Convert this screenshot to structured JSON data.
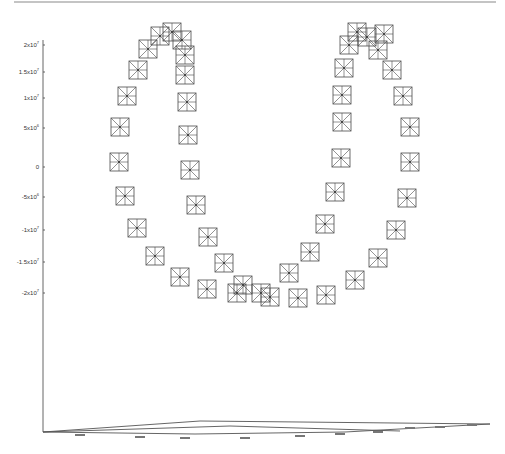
{
  "chart_data": {
    "type": "scatter",
    "projection": "3d",
    "title": "",
    "xlabel": "",
    "ylabel": "",
    "zlabel": "",
    "z_axis": {
      "tick_labels": [
        "2x10^7",
        "1.5x10^7",
        "1x10^7",
        "5x10^6",
        "0",
        "-5x10^6",
        "-1x10^7",
        "-1.5x10^7",
        "-2x10^7"
      ],
      "tick_values": [
        20000000,
        15000000,
        10000000,
        5000000,
        0,
        -5000000,
        -10000000,
        -15000000,
        -20000000
      ],
      "range": [
        -20000000,
        20000000
      ]
    },
    "floor_axes_tick_labels_legible": false,
    "grid": false,
    "legend": null,
    "marker": "square-with-asterisk",
    "marker_color": "#4a4a4a",
    "series": [
      {
        "name": "left-loop",
        "points_px": [
          [
            148,
            49
          ],
          [
            138,
            70
          ],
          [
            127,
            96
          ],
          [
            120,
            127
          ],
          [
            119,
            162
          ],
          [
            125,
            196
          ],
          [
            137,
            228
          ],
          [
            155,
            256
          ],
          [
            180,
            277
          ],
          [
            207,
            289
          ],
          [
            237,
            293
          ],
          [
            160,
            36
          ],
          [
            172,
            32
          ],
          [
            182,
            40
          ],
          [
            185,
            55
          ],
          [
            185,
            75
          ],
          [
            187,
            102
          ],
          [
            188,
            135
          ],
          [
            190,
            170
          ],
          [
            196,
            205
          ],
          [
            208,
            237
          ],
          [
            224,
            263
          ],
          [
            243,
            285
          ],
          [
            261,
            293
          ],
          [
            270,
            297
          ]
        ]
      },
      {
        "name": "right-loop",
        "points_px": [
          [
            349,
            45
          ],
          [
            357,
            32
          ],
          [
            367,
            37
          ],
          [
            378,
            50
          ],
          [
            384,
            34
          ],
          [
            392,
            70
          ],
          [
            403,
            96
          ],
          [
            410,
            127
          ],
          [
            410,
            162
          ],
          [
            407,
            198
          ],
          [
            396,
            230
          ],
          [
            378,
            258
          ],
          [
            355,
            280
          ],
          [
            326,
            295
          ],
          [
            298,
            298
          ],
          [
            344,
            68
          ],
          [
            342,
            95
          ],
          [
            342,
            122
          ],
          [
            341,
            158
          ],
          [
            335,
            192
          ],
          [
            325,
            224
          ],
          [
            310,
            252
          ],
          [
            289,
            273
          ]
        ]
      }
    ]
  },
  "layout": {
    "marker_size": 18,
    "z_axis_x": 43,
    "z_axis_top": 40,
    "z_axis_bottom": 432,
    "tick_y": [
      45,
      72,
      98,
      128,
      167,
      197,
      230,
      262,
      293
    ]
  }
}
